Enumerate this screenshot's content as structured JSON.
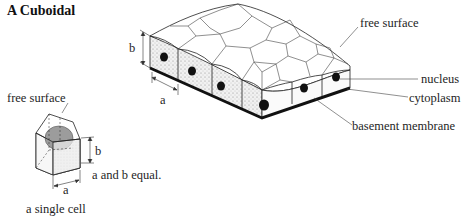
{
  "title": "A  Cuboidal",
  "main_diagram": {
    "labels": {
      "free_surface": "free surface",
      "nucleus": "nucleus",
      "cytoplasm": "cytoplasm",
      "basement_membrane": "basement membrane",
      "dim_b": "b",
      "dim_a": "a"
    }
  },
  "single_cell": {
    "labels": {
      "free_surface": "free surface",
      "dim_b": "b",
      "dim_a": "a",
      "note": "a and b equal.",
      "caption": "a single cell"
    }
  },
  "colors": {
    "line": "#222222",
    "cytoplasm_stipple": "#d9d9d9",
    "nucleus": "#111111",
    "single_nucleus": "#9a9a9a",
    "basement_membrane": "#111111"
  }
}
